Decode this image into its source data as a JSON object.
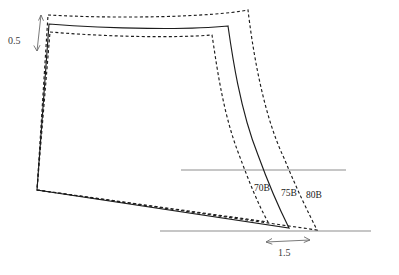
{
  "diagram": {
    "kind": "pattern-grading-nest",
    "background_color": "#ffffff",
    "line_color": "#1c1c1c",
    "reference_line_color": "#8e8e8e",
    "dimension_color": "#6b6b6b",
    "size_labels": [
      {
        "id": "size-70b",
        "text": "70B",
        "x": 254,
        "y": 191,
        "style": "dashed",
        "role": "smallest-size"
      },
      {
        "id": "size-75b",
        "text": "75B",
        "x": 281,
        "y": 196,
        "style": "solid",
        "role": "base-size"
      },
      {
        "id": "size-80b",
        "text": "80B",
        "x": 306,
        "y": 198,
        "style": "dashed",
        "role": "largest-size"
      }
    ],
    "dimensions": [
      {
        "id": "dim-vertical",
        "text": "0.5",
        "label_x": 8,
        "label_y": 44,
        "orientation": "vertical",
        "arrow_from": {
          "x": 41,
          "y": 15
        },
        "arrow_to": {
          "x": 37,
          "y": 51
        },
        "describes": "vertical grade step at top-left"
      },
      {
        "id": "dim-horizontal",
        "text": "1.5",
        "label_x": 278,
        "label_y": 256,
        "orientation": "horizontal",
        "arrow_from": {
          "x": 266,
          "y": 242
        },
        "arrow_to": {
          "x": 310,
          "y": 242
        },
        "describes": "horizontal grade step at bottom hem"
      }
    ],
    "reference_lines": [
      {
        "id": "ref-line-upper",
        "x1": 181,
        "y1": 170,
        "x2": 346,
        "y2": 170
      },
      {
        "id": "ref-line-lower",
        "x1": 160,
        "y1": 231,
        "x2": 371,
        "y2": 231
      }
    ],
    "outlines": [
      {
        "id": "outline-70b",
        "size": "70B",
        "style": "dashed",
        "path": "M 50 32 C 110 37 175 38 212 35 C 216 60 222 110 238 152 C 250 184 258 204 268 222 L 37 190 Z"
      },
      {
        "id": "outline-75b",
        "size": "75B",
        "style": "solid",
        "path": "M 49 24 C 112 29 190 30 228 26 C 232 54 240 110 258 155 C 270 188 280 210 289 228 L 37 190 Z"
      },
      {
        "id": "outline-80b",
        "size": "80B",
        "style": "dashed",
        "path": "M 48 15 C 120 19 212 17 248 10 C 252 44 262 112 284 158 C 298 192 308 212 317 230 L 37 190 Z"
      }
    ]
  }
}
